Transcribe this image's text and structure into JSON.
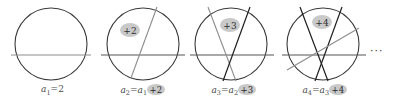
{
  "figure": {
    "title": "",
    "ellipsis": "···",
    "colors": {
      "circle_stroke": "#3a3a3a",
      "chord_dark": "#1f1f1f",
      "chord_gray": "#8d8d8d",
      "badge_fill": "#c9c9c9",
      "text": "#4a4a4a",
      "background": "#ffffff"
    },
    "panels": [
      {
        "id": "panel-1",
        "badge": "",
        "caption_lhs": "a",
        "caption_lhs_sub": "1",
        "caption_eq": "=",
        "caption_rhs": "2",
        "caption_rhs_sub": "",
        "caption_badge": "",
        "caption_full": "a1 = 2",
        "regions": 2,
        "lines": 1
      },
      {
        "id": "panel-2",
        "badge": "+2",
        "caption_lhs": "a",
        "caption_lhs_sub": "2",
        "caption_eq": "=",
        "caption_rhs": "a",
        "caption_rhs_sub": "1",
        "caption_badge": "+2",
        "caption_full": "a2 = a1 +2",
        "regions": 4,
        "lines": 2
      },
      {
        "id": "panel-3",
        "badge": "+3",
        "caption_lhs": "a",
        "caption_lhs_sub": "3",
        "caption_eq": "=",
        "caption_rhs": "a",
        "caption_rhs_sub": "2",
        "caption_badge": "+3",
        "caption_full": "a3 = a2 +3",
        "regions": 7,
        "lines": 3
      },
      {
        "id": "panel-4",
        "badge": "+4",
        "caption_lhs": "a",
        "caption_lhs_sub": "4",
        "caption_eq": "=",
        "caption_rhs": "a",
        "caption_rhs_sub": "3",
        "caption_badge": "+4",
        "caption_full": "a4 = a3 +4",
        "regions": 11,
        "lines": 4
      }
    ]
  }
}
